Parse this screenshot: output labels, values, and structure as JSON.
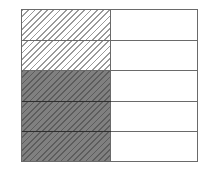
{
  "figure": {
    "rows": 5,
    "columns": 2,
    "rows_detail": [
      {
        "left": "light-hatched",
        "right": "white"
      },
      {
        "left": "light-hatched",
        "right": "white"
      },
      {
        "left": "dark-hatched",
        "right": "white"
      },
      {
        "left": "dark-hatched",
        "right": "white"
      },
      {
        "left": "dark-hatched",
        "right": "white"
      }
    ],
    "counts": {
      "light_hatched_cells": 2,
      "dark_hatched_cells": 3,
      "white_cells": 5,
      "total_cells": 10
    },
    "colors": {
      "border": "#6a6a6a",
      "light_hatch_line": "#9a9a9a",
      "dark_fill": "#7c7c7c",
      "dark_hatch_line": "#5c5c5c",
      "background": "#ffffff"
    }
  }
}
